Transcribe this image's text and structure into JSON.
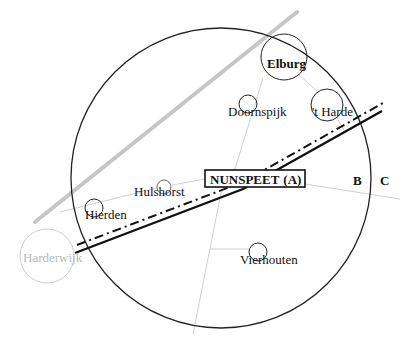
{
  "diagram": {
    "center_label": {
      "main": "NUNSPEET",
      "suffix": "(A)"
    },
    "zone_labels": [
      "B",
      "C"
    ],
    "towns": [
      {
        "name": "Elburg",
        "style": "bold"
      },
      {
        "name": "Doornspijk",
        "style": "normal"
      },
      {
        "name": "'t Harde",
        "style": "normal"
      },
      {
        "name": "Hulshorst",
        "style": "normal"
      },
      {
        "name": "Hierden",
        "style": "normal"
      },
      {
        "name": "Harderwijk",
        "style": "faded"
      },
      {
        "name": "Vierhouten",
        "style": "normal"
      }
    ],
    "colors": {
      "ink": "#111111",
      "thin_line": "#c8c8c8",
      "gray_line": "#c4c4c4",
      "faded": "#b8b8b8"
    }
  }
}
